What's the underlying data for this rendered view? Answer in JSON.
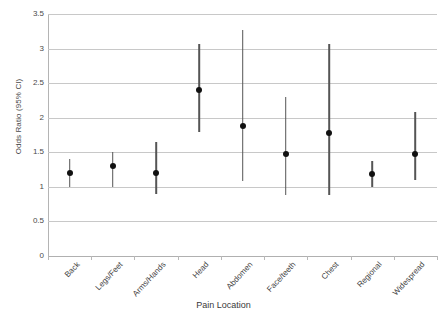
{
  "chart_data": {
    "type": "scatter",
    "title": "",
    "xlabel": "Pain Location",
    "ylabel": "Odds Ratio (95% CI)",
    "ylim": [
      0,
      3.5
    ],
    "yticks": [
      "0",
      "0.5",
      "1",
      "1.5",
      "2",
      "2.5",
      "3",
      "3.5"
    ],
    "ytick_values": [
      0,
      0.5,
      1,
      1.5,
      2,
      2.5,
      3,
      3.5
    ],
    "grid": true,
    "legend": "none",
    "categories": [
      "Back",
      "Legs/Feet",
      "Arms/Hands",
      "Head",
      "Abdomen",
      "Face/teeth",
      "Chest",
      "Regional",
      "Widespread"
    ],
    "series": [
      {
        "name": "Odds Ratio",
        "values": [
          1.2,
          1.3,
          1.2,
          2.4,
          1.88,
          1.48,
          1.78,
          1.18,
          1.47
        ],
        "ci_lower": [
          1.0,
          1.0,
          0.9,
          1.8,
          1.08,
          0.88,
          0.88,
          1.0,
          1.1
        ],
        "ci_upper": [
          1.4,
          1.5,
          1.65,
          3.07,
          3.27,
          2.3,
          3.06,
          1.38,
          2.08
        ]
      }
    ],
    "points": [
      {
        "category": "Back",
        "or": 1.2,
        "lower": 1.0,
        "upper": 1.4
      },
      {
        "category": "Legs/Feet",
        "or": 1.3,
        "lower": 1.0,
        "upper": 1.5
      },
      {
        "category": "Arms/Hands",
        "or": 1.2,
        "lower": 0.9,
        "upper": 1.65
      },
      {
        "category": "Head",
        "or": 2.4,
        "lower": 1.8,
        "upper": 3.07
      },
      {
        "category": "Abdomen",
        "or": 1.88,
        "lower": 1.08,
        "upper": 3.27
      },
      {
        "category": "Face/teeth",
        "or": 1.48,
        "lower": 0.88,
        "upper": 2.3
      },
      {
        "category": "Chest",
        "or": 1.78,
        "lower": 0.88,
        "upper": 3.06
      },
      {
        "category": "Regional",
        "or": 1.18,
        "lower": 1.0,
        "upper": 1.38
      },
      {
        "category": "Widespread",
        "or": 1.47,
        "lower": 1.1,
        "upper": 2.08
      }
    ],
    "colors": {
      "marker": "#111111",
      "whisker": "#555555",
      "grid": "#c8c8c8",
      "axis": "#b4b4b4",
      "text": "#3f3f3f",
      "background": "#ffffff"
    }
  }
}
